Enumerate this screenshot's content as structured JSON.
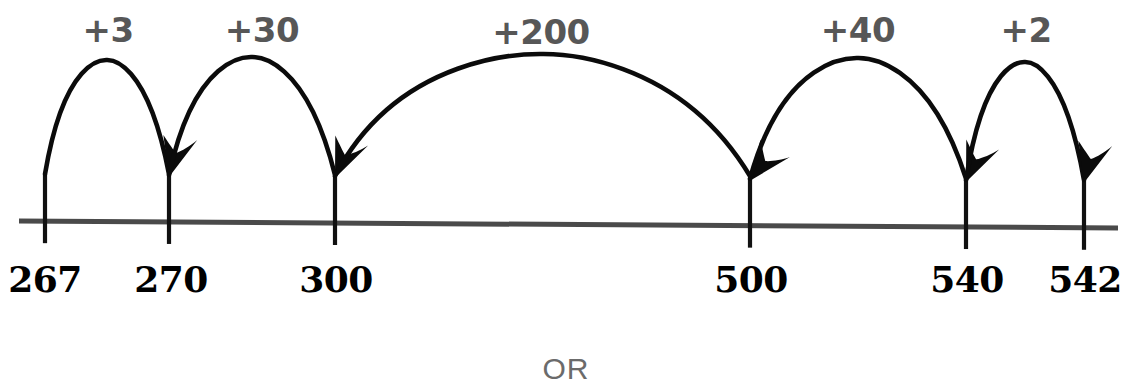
{
  "diagram": {
    "colors": {
      "line": "#4a4a4a",
      "tick": "#111111",
      "arc": "#0b0b0b",
      "jump_label": "#575757",
      "tick_label": "#000000",
      "or_text": "#6b6b6b",
      "background": "#ffffff"
    },
    "axis": {
      "start_x": 19,
      "end_x": 1118,
      "y_left": 221,
      "y_right": 228,
      "thickness": 5
    },
    "ticks": [
      {
        "value": "267",
        "x": 45,
        "label_x": 45,
        "label_y": 258
      },
      {
        "value": "270",
        "x": 169,
        "label_x": 171,
        "label_y": 258
      },
      {
        "value": "300",
        "x": 335,
        "label_x": 336,
        "label_y": 258
      },
      {
        "value": "500",
        "x": 750,
        "label_x": 751,
        "label_y": 258
      },
      {
        "value": "540",
        "x": 966,
        "label_x": 967,
        "label_y": 258
      },
      {
        "value": "542",
        "x": 1084,
        "label_x": 1085,
        "label_y": 258
      }
    ],
    "jumps": [
      {
        "label": "+3",
        "from": "267",
        "to": "270",
        "x1": 45,
        "x2": 169,
        "apex_y": 60,
        "label_x": 108,
        "label_y": 10
      },
      {
        "label": "+30",
        "from": "270",
        "to": "300",
        "x1": 169,
        "x2": 335,
        "apex_y": 57,
        "label_x": 262,
        "label_y": 10
      },
      {
        "label": "+200",
        "from": "300",
        "to": "500",
        "x1": 335,
        "x2": 750,
        "apex_y": 54,
        "label_x": 541,
        "label_y": 12
      },
      {
        "label": "+40",
        "from": "500",
        "to": "540",
        "x1": 750,
        "x2": 966,
        "apex_y": 58,
        "label_x": 858,
        "label_y": 10
      },
      {
        "label": "+2",
        "from": "540",
        "to": "542",
        "x1": 966,
        "x2": 1084,
        "apex_y": 62,
        "label_x": 1026,
        "label_y": 10
      }
    ],
    "footer": {
      "or_label": "OR",
      "x": 566,
      "y": 352
    }
  }
}
